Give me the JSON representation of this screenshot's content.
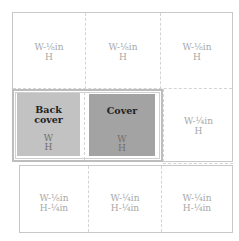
{
  "layout": {
    "rows": [
      {
        "cells": [
          {
            "w": "W-⅛in",
            "h": "H"
          },
          {
            "w": "W-⅛in",
            "h": "H"
          },
          {
            "w": "W-⅛in",
            "h": "H"
          }
        ]
      },
      {
        "cells": [
          {
            "title_line1": "Back",
            "title_line2": "cover",
            "w": "W",
            "h": "H"
          },
          {
            "title_line1": "Cover",
            "w": "W",
            "h": "H"
          },
          {
            "w": "W-¼in",
            "h": "H"
          }
        ]
      },
      {
        "cells": [
          {
            "w": "W-⅛in",
            "h": "H-¼in"
          },
          {
            "w": "W-¼in",
            "h": "H-¼in"
          },
          {
            "w": "W-¼in",
            "h": "H-¼in"
          }
        ]
      }
    ]
  },
  "colors": {
    "back_cover_fill": "#c2c2c2",
    "cover_fill": "#a3a3a3",
    "border": "#c8c8c8",
    "label_text": "#a8a8a8"
  }
}
